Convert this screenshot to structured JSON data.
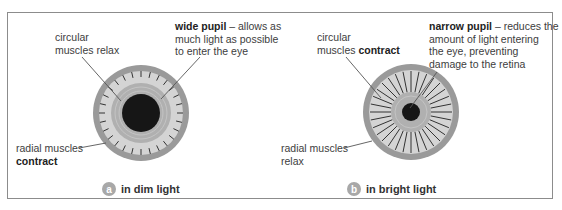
{
  "panels": [
    {
      "id": "a",
      "caption": "in dim light",
      "label_top_left": {
        "line1": "circular",
        "line2": "muscles relax"
      },
      "label_top_right": {
        "bold": "wide pupil",
        "rest": " – allows as",
        "line2": "much light as possible",
        "line3": "to enter the eye"
      },
      "label_bottom_left": {
        "line1": "radial muscles",
        "line2_bold": "contract"
      },
      "pupil": "wide"
    },
    {
      "id": "b",
      "caption": "in bright light",
      "label_top_left": {
        "line1": "circular",
        "line2_prefix": "muscles ",
        "line2_bold": "contract"
      },
      "label_top_right": {
        "bold": "narrow pupil",
        "rest": " – reduces the",
        "line2": "amount of light entering",
        "line3": "the eye, preventing",
        "line4": "damage to the retina"
      },
      "label_bottom_left": {
        "line1": "radial muscles",
        "line2": "relax"
      },
      "pupil": "narrow"
    }
  ],
  "colors": {
    "border": "#8c8c8c",
    "iris_outer": "#9a9a9a",
    "radial_band": "#d4d4d4",
    "circular_band": "#b0b0b0",
    "pupil": "#161616",
    "badge": "#a8a8a8"
  }
}
